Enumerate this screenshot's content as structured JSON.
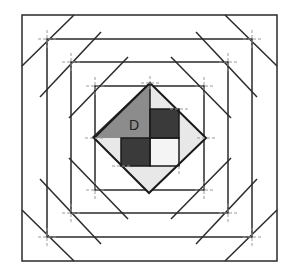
{
  "diagram": {
    "center_label": "D",
    "colors": {
      "line": "#2a2a2a",
      "guide": "#9a9a9a",
      "triangle_d": "#8c8c8c",
      "dark_square": "#3a3a3a",
      "light_fill": "#e8e8e8",
      "background": "#ffffff"
    },
    "outer_square": [
      22,
      15,
      277,
      261
    ],
    "rectangles": [
      [
        47,
        39,
        252,
        237
      ],
      [
        71,
        62,
        228,
        213
      ],
      [
        95,
        86,
        204,
        190
      ]
    ],
    "diamond": {
      "top": [
        150,
        83
      ],
      "right": [
        206,
        138
      ],
      "bottom": [
        149,
        193
      ],
      "left": [
        94,
        138
      ]
    }
  }
}
